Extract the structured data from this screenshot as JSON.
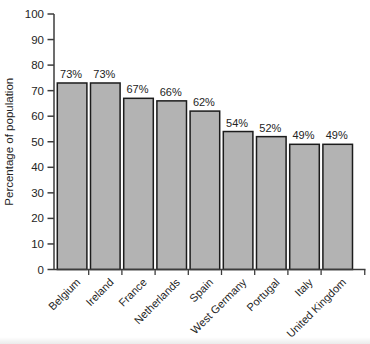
{
  "chart_data": {
    "type": "bar",
    "title": "",
    "xlabel": "",
    "ylabel": "Percentage of population",
    "categories": [
      "Belgium",
      "Ireland",
      "France",
      "Netherlands",
      "Spain",
      "West Germany",
      "Portugal",
      "Italy",
      "United Kingdom"
    ],
    "values": [
      73,
      73,
      67,
      66,
      62,
      54,
      52,
      49,
      49
    ],
    "value_labels": [
      "73%",
      "73%",
      "67%",
      "66%",
      "62%",
      "54%",
      "52%",
      "49%",
      "49%"
    ],
    "ylim": [
      0,
      100
    ],
    "yticks": [
      0,
      10,
      20,
      30,
      40,
      50,
      60,
      70,
      80,
      90,
      100
    ],
    "grid": false,
    "legend_position": "none",
    "bar_fill": "#b3b3b3",
    "bar_stroke": "#1c1c1c",
    "axis_color": "#3c3c3c",
    "label_color": "#242424"
  }
}
